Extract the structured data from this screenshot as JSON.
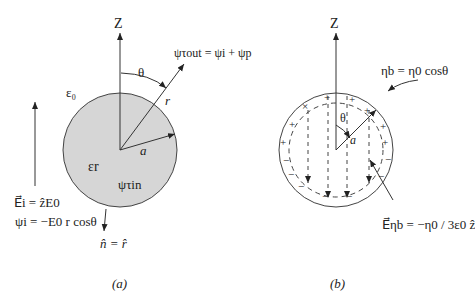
{
  "figure_a": {
    "caption": "(a)",
    "axis_label": "Z",
    "angle_label": "θ",
    "outer_medium": "ε₀",
    "inner_medium": "εr",
    "radius_label": "a",
    "position_vector": "r⃗",
    "psi_out": "ψτout = ψi + ψp",
    "psi_in": "ψτin",
    "incident_field": "E⃗i = ẑE0",
    "incident_potential": "ψi = −E0 r cosθ",
    "normal": "n̂ = r̂"
  },
  "figure_b": {
    "caption": "(b)",
    "axis_label": "Z",
    "angle_label": "θ",
    "radius_label": "a",
    "surface_charge": "ηb = η0 cosθ",
    "field_label": "E⃗ηb = −η0 / 3ε0 ẑ"
  },
  "colors": {
    "sphere_fill": "#d6d6d6",
    "line": "#333333"
  }
}
